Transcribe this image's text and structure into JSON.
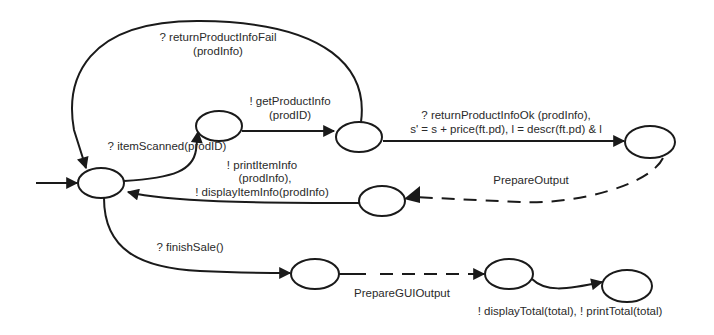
{
  "diagram": {
    "type": "state-machine",
    "colors": {
      "stroke": "#1a1a1a",
      "text": "#2a2a2a",
      "background": "#ffffff"
    },
    "states": [
      {
        "id": "s0",
        "role": "initial"
      },
      {
        "id": "s1"
      },
      {
        "id": "s2"
      },
      {
        "id": "s3"
      },
      {
        "id": "s4"
      },
      {
        "id": "s5"
      },
      {
        "id": "s6"
      },
      {
        "id": "s7"
      }
    ],
    "transitions": {
      "start": {
        "from": null,
        "to": "s0"
      },
      "item_scanned": {
        "from": "s0",
        "to": "s1",
        "label": "? itemScanned(prodID)"
      },
      "get_product_info": {
        "from": "s1",
        "to": "s2",
        "label_line1": "! getProductInfo",
        "label_line2": "(prodID)"
      },
      "return_fail": {
        "from": "s2",
        "to": "s0",
        "label_line1": "? returnProductInfoFail",
        "label_line2": "(prodInfo)"
      },
      "return_ok": {
        "from": "s2",
        "to": "s3",
        "label_line1": "? returnProductInfoOk (prodInfo),",
        "label_line2": "s' = s + price(ft.pd), l =  descr(ft.pd) & l"
      },
      "prepare_output": {
        "from": "s3",
        "to": "s4",
        "label": "PrepareOutput",
        "style": "dashed"
      },
      "print_display_item": {
        "from": "s4",
        "to": "s0",
        "label_line1": "! printItemInfo",
        "label_line2": "(prodInfo),",
        "label_line3": "! displayItemInfo(prodInfo)"
      },
      "finish_sale": {
        "from": "s0",
        "to": "s5",
        "label": "? finishSale()"
      },
      "prepare_gui_output": {
        "from": "s5",
        "to": "s6",
        "label": "PrepareGUIOutput",
        "style": "dashed"
      },
      "display_print_total": {
        "from": "s6",
        "to": "s7",
        "label": "! displayTotal(total), ! printTotal(total)"
      }
    }
  }
}
